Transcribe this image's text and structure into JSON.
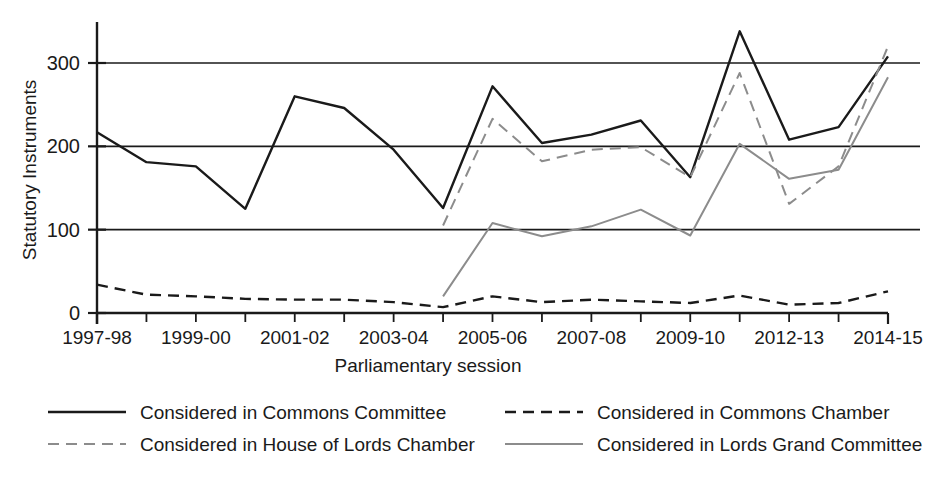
{
  "chart_data": {
    "type": "line",
    "title": "",
    "xlabel": "Parliamentary session",
    "ylabel": "Statutory Instruments",
    "ylim": [
      0,
      345
    ],
    "yticks": [
      0,
      100,
      200,
      300
    ],
    "grid": "horizontal",
    "legend_position": "bottom",
    "x": [
      "1997-98",
      "1998-99",
      "1999-00",
      "2000-01",
      "2001-02",
      "2002-03",
      "2003-04",
      "2004-05",
      "2005-06",
      "2006-07",
      "2007-08",
      "2008-09",
      "2009-10",
      "2010-12",
      "2012-13",
      "2013-14",
      "2014-15"
    ],
    "xtick_labels": [
      "1997-98",
      "",
      "1999-00",
      "",
      "2001-02",
      "",
      "2003-04",
      "",
      "2005-06",
      "",
      "2007-08",
      "",
      "2009-10",
      "",
      "2012-13",
      "",
      "2014-15"
    ],
    "series": [
      {
        "name": "Considered in Commons Committee",
        "style": "solid",
        "color": "#1a1a1a",
        "values": [
          217,
          181,
          176,
          125,
          260,
          246,
          196,
          126,
          272,
          204,
          214,
          231,
          163,
          338,
          208,
          223,
          308
        ]
      },
      {
        "name": "Considered in Commons Chamber",
        "style": "dashed",
        "color": "#1a1a1a",
        "values": [
          34,
          22,
          20,
          17,
          16,
          16,
          13,
          7,
          20,
          13,
          16,
          14,
          12,
          21,
          10,
          12,
          26
        ]
      },
      {
        "name": "Considered in House of Lords Chamber",
        "style": "dashed",
        "color": "#8c8c8c",
        "values": [
          null,
          null,
          null,
          null,
          null,
          null,
          null,
          105,
          233,
          182,
          196,
          199,
          163,
          288,
          131,
          176,
          320
        ]
      },
      {
        "name": "Considered in Lords Grand Committee",
        "style": "solid",
        "color": "#8c8c8c",
        "values": [
          null,
          null,
          null,
          null,
          null,
          null,
          null,
          20,
          108,
          92,
          104,
          124,
          93,
          203,
          161,
          172,
          283
        ]
      }
    ]
  },
  "legend": [
    {
      "label": "Considered in Commons Committee",
      "style": "solid",
      "color": "#1a1a1a"
    },
    {
      "label": "Considered in Commons Chamber",
      "style": "dashed",
      "color": "#1a1a1a"
    },
    {
      "label": "Considered in House of Lords Chamber",
      "style": "dashed",
      "color": "#8c8c8c"
    },
    {
      "label": "Considered in Lords Grand Committee",
      "style": "solid",
      "color": "#8c8c8c"
    }
  ],
  "colors": {
    "axis": "#1a1a1a",
    "gridline": "#1a1a1a",
    "dark_series": "#1a1a1a",
    "grey_series": "#8c8c8c",
    "background": "#ffffff"
  }
}
